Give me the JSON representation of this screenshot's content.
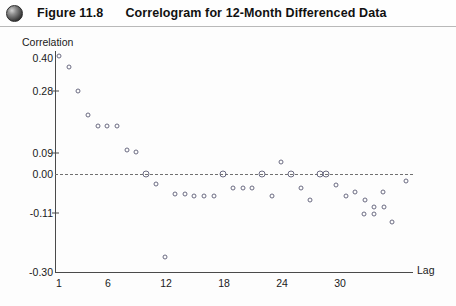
{
  "header": {
    "bullet_icon": "filled-circle-icon",
    "figure_number": "Figure 11.8",
    "figure_title": "Correlogram for 12-Month Differenced Data"
  },
  "chart_data": {
    "type": "scatter",
    "title": "Correlogram for 12-Month Differenced Data",
    "xlabel": "Lag",
    "ylabel": "Correlation",
    "grid": false,
    "legend": "none",
    "xlim": [
      0,
      37
    ],
    "ylim": [
      -0.3,
      0.45
    ],
    "xticks": [
      1,
      6,
      12,
      18,
      24,
      30
    ],
    "xtick_labels": [
      "1",
      "6",
      "12",
      "18",
      "24",
      "30"
    ],
    "yticks": [
      0.4,
      0.28,
      0.09,
      0.0,
      -0.11,
      -0.3
    ],
    "ytick_labels": [
      "0.40",
      "0.28",
      "0.09",
      "0.00",
      "-0.11",
      "-0.30"
    ],
    "reference_line": {
      "value": 0.0,
      "style": "dashed",
      "color": "#707070"
    },
    "marker": {
      "shape": "open-circle",
      "color": "#6b6b82"
    },
    "x": [
      1,
      2,
      3,
      4,
      5,
      6,
      7,
      8,
      9,
      10,
      11,
      12,
      13,
      14,
      15,
      16,
      17,
      18,
      19,
      20,
      21,
      22,
      23,
      24,
      25,
      26,
      27,
      28,
      29,
      30,
      31,
      32,
      33,
      34,
      35
    ],
    "values": [
      0.41,
      0.37,
      0.28,
      0.18,
      0.15,
      0.15,
      0.15,
      0.09,
      0.09,
      0.0,
      -0.03,
      -0.255,
      -0.04,
      -0.04,
      -0.06,
      -0.06,
      -0.06,
      0.0,
      -0.04,
      -0.04,
      -0.04,
      -0.04,
      -0.01,
      0.05,
      0.0,
      -0.04,
      -0.07,
      0.0,
      0.0,
      -0.03,
      -0.05,
      -0.06,
      -0.06,
      -0.08,
      -0.02
    ]
  },
  "points": [
    {
      "lag": 1,
      "r": 0.41,
      "px": 59.0,
      "py": 56
    },
    {
      "lag": 2,
      "r": 0.37,
      "px": 68.7,
      "py": 67
    },
    {
      "lag": 3,
      "r": 0.28,
      "px": 78.3,
      "py": 91
    },
    {
      "lag": 4,
      "r": 0.18,
      "px": 88.0,
      "py": 115
    },
    {
      "lag": 5,
      "r": 0.15,
      "px": 97.7,
      "py": 126
    },
    {
      "lag": 6,
      "r": 0.15,
      "px": 107.3,
      "py": 126
    },
    {
      "lag": 7,
      "r": 0.15,
      "px": 117.0,
      "py": 126
    },
    {
      "lag": 8,
      "r": 0.09,
      "px": 126.7,
      "py": 150
    },
    {
      "lag": 9,
      "r": 0.09,
      "px": 136.3,
      "py": 152
    },
    {
      "lag": 10,
      "r": 0.0,
      "px": 146.0,
      "py": 174
    },
    {
      "lag": 11,
      "r": -0.03,
      "px": 155.7,
      "py": 184
    },
    {
      "lag": 12,
      "r": -0.255,
      "px": 165.3,
      "py": 257
    },
    {
      "lag": 13,
      "r": -0.05,
      "px": 175.0,
      "py": 194
    },
    {
      "lag": 14,
      "r": -0.05,
      "px": 184.7,
      "py": 194
    },
    {
      "lag": 15,
      "r": -0.06,
      "px": 194.3,
      "py": 196
    },
    {
      "lag": 16,
      "r": -0.06,
      "px": 204.0,
      "py": 196
    },
    {
      "lag": 17,
      "r": -0.06,
      "px": 213.7,
      "py": 196
    },
    {
      "lag": 18,
      "r": 0.0,
      "px": 223.3,
      "py": 174
    },
    {
      "lag": 19,
      "r": -0.04,
      "px": 233.0,
      "py": 188
    },
    {
      "lag": 20,
      "r": -0.04,
      "px": 242.7,
      "py": 188
    },
    {
      "lag": 21,
      "r": -0.04,
      "px": 252.3,
      "py": 188
    },
    {
      "lag": 22,
      "r": 0.0,
      "px": 262.0,
      "py": 174
    },
    {
      "lag": 23,
      "r": -0.06,
      "px": 271.7,
      "py": 196
    },
    {
      "lag": 24,
      "r": 0.05,
      "px": 281.3,
      "py": 162
    },
    {
      "lag": 25,
      "r": 0.0,
      "px": 291.0,
      "py": 174
    },
    {
      "lag": 26,
      "r": -0.04,
      "px": 300.7,
      "py": 188
    },
    {
      "lag": 27,
      "r": -0.07,
      "px": 310.3,
      "py": 200
    },
    {
      "lag": 28,
      "r": 0.0,
      "px": 320.0,
      "py": 174
    },
    {
      "lag": 29,
      "r": 0.0,
      "px": 326.0,
      "py": 174
    },
    {
      "lag": 30,
      "r": -0.03,
      "px": 336.0,
      "py": 185
    },
    {
      "lag": 31,
      "r": -0.06,
      "px": 345.5,
      "py": 196
    },
    {
      "lag": 32,
      "r": -0.05,
      "px": 355.0,
      "py": 192
    },
    {
      "lag": 33,
      "r": -0.07,
      "px": 364.5,
      "py": 200
    },
    {
      "lag": 34,
      "r": -0.09,
      "px": 374.0,
      "py": 207
    },
    {
      "lag": 35,
      "r": -0.09,
      "px": 383.5,
      "py": 207
    },
    {
      "lag": 36,
      "r": -0.11,
      "px": 364.0,
      "py": 214
    },
    {
      "lag": 37,
      "r": -0.11,
      "px": 373.5,
      "py": 214
    },
    {
      "lag": 38,
      "r": -0.13,
      "px": 392.0,
      "py": 222
    },
    {
      "lag": 39,
      "r": -0.02,
      "px": 406.0,
      "py": 181
    },
    {
      "lag": 40,
      "r": -0.05,
      "px": 383.0,
      "py": 192
    }
  ],
  "ytick_positions": [
    {
      "label": "0.40",
      "py": 58
    },
    {
      "label": "0.28",
      "py": 91
    },
    {
      "label": "0.09",
      "py": 153
    },
    {
      "label": "0.00",
      "py": 174
    },
    {
      "label": "-0.11",
      "py": 213
    },
    {
      "label": "-0.30",
      "py": 272
    }
  ],
  "xtick_positions": [
    {
      "label": "1",
      "px": 59
    },
    {
      "label": "6",
      "px": 108
    },
    {
      "label": "12",
      "px": 166
    },
    {
      "label": "18",
      "px": 224
    },
    {
      "label": "24",
      "px": 282
    },
    {
      "label": "30",
      "px": 340
    }
  ]
}
